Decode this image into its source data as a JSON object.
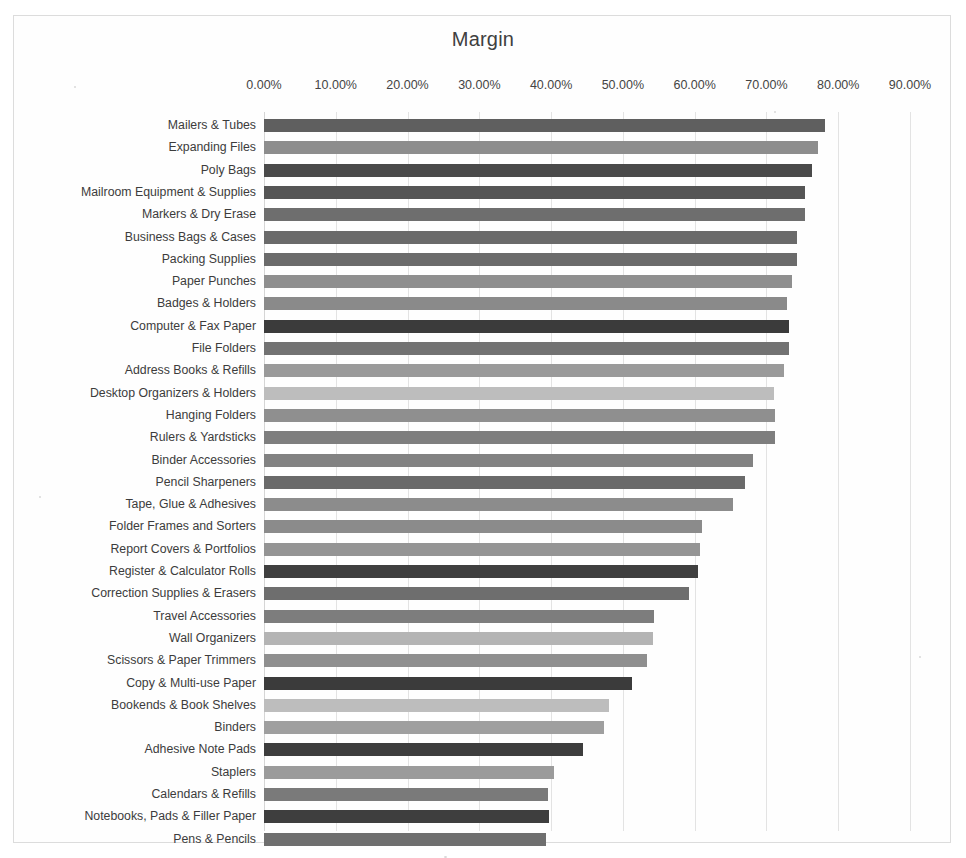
{
  "chart_data": {
    "type": "bar",
    "orientation": "horizontal",
    "title": "Margin",
    "xlabel": "",
    "ylabel": "",
    "xlim": [
      0,
      0.9
    ],
    "grid": true,
    "legend": false,
    "x_tick_labels": [
      "0.00%",
      "10.00%",
      "20.00%",
      "30.00%",
      "40.00%",
      "50.00%",
      "60.00%",
      "70.00%",
      "80.00%",
      "90.00%"
    ],
    "x_tick_values": [
      0,
      10,
      20,
      30,
      40,
      50,
      60,
      70,
      80,
      90
    ],
    "value_unit": "percent",
    "categories": [
      "Mailers & Tubes",
      "Expanding Files",
      "Poly Bags",
      "Mailroom Equipment & Supplies",
      "Markers & Dry Erase",
      "Business Bags & Cases",
      "Packing Supplies",
      "Paper Punches",
      "Badges & Holders",
      "Computer & Fax Paper",
      "File Folders",
      "Address Books & Refills",
      "Desktop Organizers & Holders",
      "Hanging Folders",
      "Rulers & Yardsticks",
      "Binder Accessories",
      "Pencil Sharpeners",
      "Tape, Glue & Adhesives",
      "Folder Frames and Sorters",
      "Report Covers & Portfolios",
      "Register & Calculator Rolls",
      "Correction Supplies & Erasers",
      "Travel Accessories",
      "Wall Organizers",
      "Scissors & Paper Trimmers",
      "Copy & Multi-use Paper",
      "Bookends & Book Shelves",
      "Binders",
      "Adhesive Note Pads",
      "Staplers",
      "Calendars & Refills",
      "Notebooks, Pads & Filler Paper",
      "Pens & Pencils"
    ],
    "values": [
      78.2,
      77.2,
      76.3,
      75.4,
      75.4,
      74.3,
      74.2,
      73.6,
      72.8,
      73.2,
      73.2,
      72.4,
      71.1,
      71.2,
      71.2,
      68.1,
      67.0,
      65.4,
      61.0,
      60.7,
      60.4,
      59.2,
      54.3,
      54.2,
      53.3,
      51.3,
      48.0,
      47.3,
      44.5,
      40.4,
      39.5,
      39.7,
      39.3
    ],
    "bar_colors": [
      "#5f5f5f",
      "#8d8d8d",
      "#4a4a4a",
      "#555555",
      "#6e6e6e",
      "#6a6a6a",
      "#6b6b6b",
      "#8f8f8f",
      "#8a8a8a",
      "#3b3b3b",
      "#727272",
      "#9a9a9a",
      "#bdbdbd",
      "#8f8f8f",
      "#7e7e7e",
      "#828282",
      "#6a6a6a",
      "#8c8c8c",
      "#8b8b8b",
      "#949494",
      "#3f3f3f",
      "#6e6e6e",
      "#7d7d7d",
      "#b4b4b4",
      "#8f8f8f",
      "#3b3b3b",
      "#bdbdbd",
      "#9f9f9f",
      "#3d3d3d",
      "#9b9b9b",
      "#7a7a7a",
      "#3e3e3e",
      "#6f6f6f"
    ]
  }
}
